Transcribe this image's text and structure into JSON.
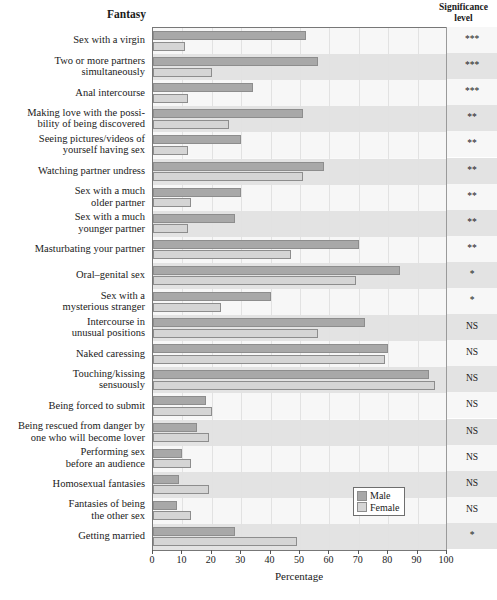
{
  "headers": {
    "category_header": "Fantasy",
    "significance_header_line1": "Significance",
    "significance_header_line2": "level"
  },
  "legend": {
    "male_label": "Male",
    "female_label": "Female",
    "male_color": "#a8a8a8",
    "female_color": "#d5d5d5"
  },
  "axis": {
    "title": "Percentage",
    "ticks": [
      0,
      10,
      20,
      30,
      40,
      50,
      60,
      70,
      80,
      90,
      100
    ]
  },
  "chart_data": {
    "type": "bar",
    "title": "",
    "xlabel": "Percentage",
    "ylabel": "Fantasy",
    "xlim": [
      0,
      100
    ],
    "grid": true,
    "legend_position": "inside-bottom-right",
    "orientation": "horizontal",
    "categories": [
      "Sex with a virgin",
      "Two or more partners simultaneously",
      "Anal intercourse",
      "Making love with the possibility of being discovered",
      "Seeing pictures/videos of yourself having sex",
      "Watching partner undress",
      "Sex with a much older partner",
      "Sex with a much younger partner",
      "Masturbating your partner",
      "Oral–genital sex",
      "Sex with a mysterious stranger",
      "Intercourse in unusual positions",
      "Naked caressing",
      "Touching/kissing sensuously",
      "Being forced to submit",
      "Being rescued from danger by one who will become lover",
      "Performing sex before an audience",
      "Homosexual fantasies",
      "Fantasies of being the other sex",
      "Getting married"
    ],
    "series": [
      {
        "name": "Male",
        "color": "#a8a8a8",
        "values": [
          52,
          56,
          34,
          51,
          30,
          58,
          30,
          28,
          70,
          84,
          40,
          72,
          80,
          94,
          18,
          15,
          10,
          9,
          8,
          28
        ]
      },
      {
        "name": "Female",
        "color": "#d5d5d5",
        "values": [
          11,
          20,
          12,
          26,
          12,
          51,
          13,
          12,
          47,
          69,
          23,
          56,
          79,
          96,
          20,
          19,
          13,
          19,
          13,
          49
        ]
      }
    ],
    "significance_levels": [
      "***",
      "***",
      "***",
      "**",
      "**",
      "**",
      "**",
      "**",
      "**",
      "*",
      "*",
      "NS",
      "NS",
      "NS",
      "NS",
      "NS",
      "NS",
      "NS",
      "NS",
      "*"
    ],
    "category_label_lines": [
      [
        "Sex with a virgin"
      ],
      [
        "Two or more partners",
        "simultaneously"
      ],
      [
        "Anal intercourse"
      ],
      [
        "Making love with the possi-",
        "bility of being discovered"
      ],
      [
        "Seeing pictures/videos of",
        "yourself having sex"
      ],
      [
        "Watching partner undress"
      ],
      [
        "Sex with a much",
        "older partner"
      ],
      [
        "Sex with a much",
        "younger partner"
      ],
      [
        "Masturbating your partner"
      ],
      [
        "Oral–genital sex"
      ],
      [
        "Sex with a",
        "mysterious stranger"
      ],
      [
        "Intercourse in",
        "unusual positions"
      ],
      [
        "Naked caressing"
      ],
      [
        "Touching/kissing",
        "sensuously"
      ],
      [
        "Being forced to submit"
      ],
      [
        "Being rescued from danger by",
        "one who will become lover"
      ],
      [
        "Performing sex",
        "before an audience"
      ],
      [
        "Homosexual fantasies"
      ],
      [
        "Fantasies of being",
        "the other sex"
      ],
      [
        "Getting married"
      ]
    ]
  }
}
